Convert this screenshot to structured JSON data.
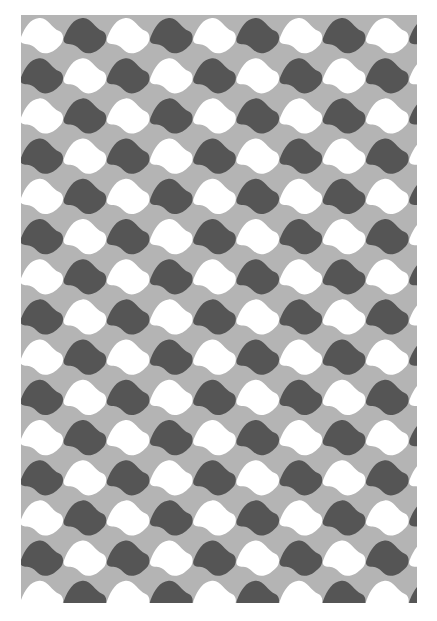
{
  "canvas": {
    "width": 437,
    "height": 621,
    "background": "#ffffff"
  },
  "pattern": {
    "description": "Tessellated wavy lozenge shapes in alternating checkerboard of white and dark gray on a mid-gray ground",
    "region": {
      "x": 21,
      "y": 15,
      "width": 396,
      "height": 588
    },
    "ground_color": "#b4b4b4",
    "shape_colors": [
      "#ffffff",
      "#555555"
    ],
    "cell_width": 43.2,
    "cell_height": 40.2,
    "columns": 10,
    "rows": 15,
    "first_cell_color_index": 0
  }
}
